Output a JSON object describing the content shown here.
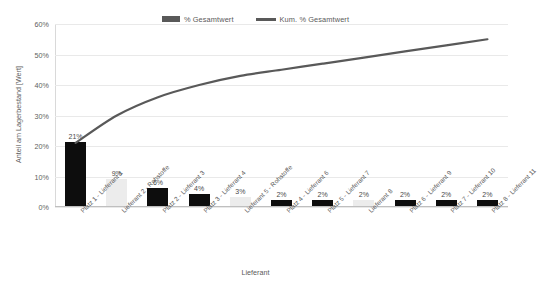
{
  "chart_data": {
    "type": "bar",
    "title": "",
    "subtitle": "",
    "xlabel": "Lieferant",
    "ylabel": "Anteil am Lagerbestand [Wert]",
    "ylim": [
      0,
      60
    ],
    "ytick_labels": [
      "60%",
      "50%",
      "40%",
      "30%",
      "20%",
      "10%",
      "0%"
    ],
    "ytick_values": [
      60,
      50,
      40,
      30,
      20,
      10,
      0
    ],
    "grid": true,
    "legend_position": "top-center",
    "categories": [
      "Platz 1 - Lieferant 1",
      "Lieferant 2 - Rohstoffe",
      "Platz 2 - Lieferant 3",
      "Platz 3 - Lieferant 4",
      "Lieferant 5 - Rohstoffe",
      "Platz 4 - Lieferant 6",
      "Platz 5 - Lieferant 7",
      "Lieferant 8",
      "Platz 6 - Lieferant 9",
      "Platz 7 - Lieferant 10",
      "Platz 8 - Lieferant 11"
    ],
    "series": [
      {
        "name": "% Gesamtwert",
        "kind": "bar",
        "color": "#0d0d0d",
        "alt_color": "#ececec",
        "values": [
          21,
          9,
          6,
          4,
          3,
          2,
          2,
          2,
          2,
          2,
          2
        ],
        "data_labels": [
          "21%",
          "9%",
          "6%",
          "4%",
          "3%",
          "2%",
          "2%",
          "2%",
          "2%",
          "2%",
          "2%"
        ],
        "highlighted_indices": [
          1,
          4,
          7
        ]
      },
      {
        "name": "Kum. % Gesamtwert",
        "kind": "line",
        "color": "#595959",
        "values": [
          21,
          30,
          36,
          40,
          43,
          45,
          47,
          49,
          51,
          53,
          55
        ]
      }
    ]
  },
  "legend": {
    "entries": [
      {
        "label": "% Gesamtwert",
        "marker": "bar-swatch"
      },
      {
        "label": "Kum. % Gesamtwert",
        "marker": "line-swatch"
      }
    ]
  },
  "axes": {
    "y_title": "Anteil am Lagerbestand [Wert]",
    "x_title": "Lieferant"
  }
}
